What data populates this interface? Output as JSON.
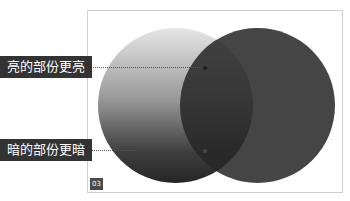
{
  "diagram": {
    "labels": {
      "bright": "亮的部份更亮",
      "dark": "暗的部份更暗"
    },
    "badge": "03",
    "colors": {
      "label_bg": "#333333",
      "label_text": "#ffffff",
      "frame_border": "#cfcfcf",
      "right_circle": "#262626"
    }
  }
}
